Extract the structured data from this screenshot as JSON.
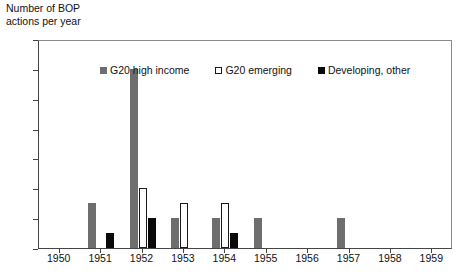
{
  "chart_data": {
    "type": "bar",
    "title": "Number of BOP\nactions per year",
    "xlabel": "",
    "ylabel": "",
    "ylim": [
      0,
      14
    ],
    "ytick_step": 2,
    "yticks": [
      "0",
      "2",
      "4",
      "6",
      "8",
      "10",
      "12",
      "14"
    ],
    "grid": false,
    "legend_position": "inside-top-center",
    "categories": [
      "1950",
      "1951",
      "1952",
      "1953",
      "1954",
      "1955",
      "1956",
      "1957",
      "1958",
      "1959"
    ],
    "series": [
      {
        "name": "G20 high income",
        "color": "#6e6e6e",
        "values": [
          0,
          3,
          12,
          2,
          2,
          2,
          0,
          2,
          0,
          0
        ]
      },
      {
        "name": "G20 emerging",
        "color": "#ffffff",
        "values": [
          0,
          0,
          4,
          3,
          3,
          0,
          0,
          0,
          0,
          0
        ]
      },
      {
        "name": "Developing, other",
        "color": "#0a0a0a",
        "values": [
          0,
          1,
          2,
          0,
          1,
          0,
          0,
          0,
          0,
          0
        ]
      }
    ]
  }
}
